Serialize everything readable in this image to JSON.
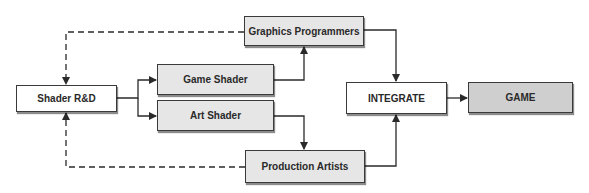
{
  "diagram": {
    "nodes": [
      {
        "id": "shader_rd",
        "label": "Shader R&D"
      },
      {
        "id": "game_shader",
        "label": "Game Shader"
      },
      {
        "id": "art_shader",
        "label": "Art Shader"
      },
      {
        "id": "graphics_programmers",
        "label": "Graphics Programmers"
      },
      {
        "id": "production_artists",
        "label": "Production Artists"
      },
      {
        "id": "integrate",
        "label": "INTEGRATE"
      },
      {
        "id": "game",
        "label": "GAME"
      }
    ],
    "edges": [
      {
        "from": "shader_rd",
        "to": "game_shader",
        "style": "solid"
      },
      {
        "from": "shader_rd",
        "to": "art_shader",
        "style": "solid"
      },
      {
        "from": "game_shader",
        "to": "graphics_programmers",
        "style": "solid"
      },
      {
        "from": "art_shader",
        "to": "production_artists",
        "style": "solid"
      },
      {
        "from": "graphics_programmers",
        "to": "integrate",
        "style": "solid"
      },
      {
        "from": "production_artists",
        "to": "integrate",
        "style": "solid"
      },
      {
        "from": "integrate",
        "to": "game",
        "style": "solid"
      },
      {
        "from": "graphics_programmers",
        "to": "shader_rd",
        "style": "dashed"
      },
      {
        "from": "production_artists",
        "to": "shader_rd",
        "style": "dashed"
      }
    ],
    "colors": {
      "line": "#2a2a2a",
      "white_box": "#ffffff",
      "light_box": "#e6e6e6",
      "dark_box": "#cfcfcf"
    }
  }
}
